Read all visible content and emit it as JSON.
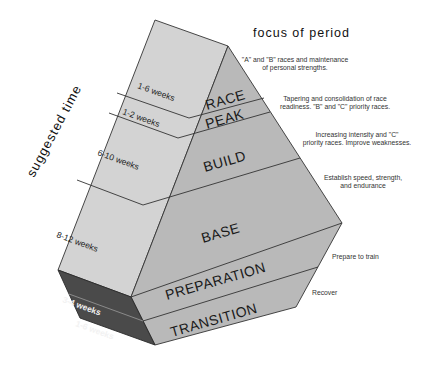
{
  "diagram": {
    "header": "focus of period",
    "axis_label": "suggested time",
    "phases": [
      {
        "name": "RACE",
        "duration": "1-6 weeks",
        "focus": [
          "\"A\" and \"B\" races and maintenance",
          "of personal strengths."
        ]
      },
      {
        "name": "PEAK",
        "duration": "1-2 weeks",
        "focus": [
          "Tapering and consolidation of race",
          "readiness. \"B\" and \"C\" priority races."
        ]
      },
      {
        "name": "BUILD",
        "duration": "6-10 weeks",
        "focus": [
          "Increasing intensity and \"C\"",
          "priority races. Improve weaknesses."
        ]
      },
      {
        "name": "BASE",
        "duration": "8-12 weeks",
        "focus": [
          "Establish speed, strength,",
          "and endurance"
        ]
      },
      {
        "name": "PREPARATION",
        "duration": "3-4 weeks",
        "focus": [
          "Prepare to train"
        ]
      },
      {
        "name": "TRANSITION",
        "duration": "1-6 weeks",
        "focus": [
          "Recover"
        ]
      }
    ],
    "colors": {
      "side_face": "#d3d3d3",
      "front_face": "#b9b9b9",
      "dark_face": "#4a4a4a",
      "outline": "#333333"
    }
  }
}
